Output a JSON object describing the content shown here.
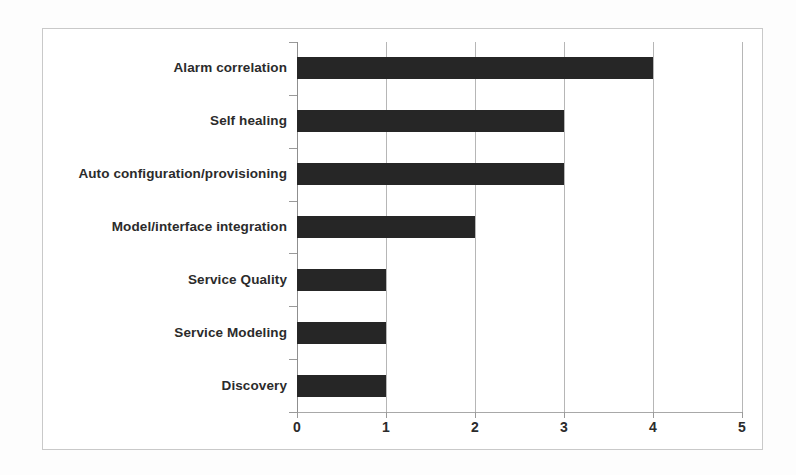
{
  "chart_data": {
    "type": "bar",
    "orientation": "horizontal",
    "title": "",
    "subtitle": "",
    "xlabel": "",
    "ylabel": "",
    "categories": [
      "Alarm correlation",
      "Self healing",
      "Auto configuration/provisioning",
      "Model/interface integration",
      "Service Quality",
      "Service Modeling",
      "Discovery"
    ],
    "values": [
      4,
      3,
      3,
      2,
      1,
      1,
      1
    ],
    "series": [
      {
        "name": "",
        "values": [
          4,
          3,
          3,
          2,
          1,
          1,
          1
        ]
      }
    ],
    "xlim": [
      0,
      5
    ],
    "xticks": [
      0,
      1,
      2,
      3,
      4,
      5
    ],
    "xtick_labels": [
      "0",
      "1",
      "2",
      "3",
      "4",
      "5"
    ],
    "yticks": [],
    "grid": "vertical",
    "legend": "none",
    "annotations": [],
    "colors": {
      "bar": "#262626",
      "gridline": "#b6b6b6",
      "axis": "#8f8f8f",
      "frame": "#c9c9c9",
      "text": "#2b2b2b",
      "background": "#ffffff"
    }
  }
}
